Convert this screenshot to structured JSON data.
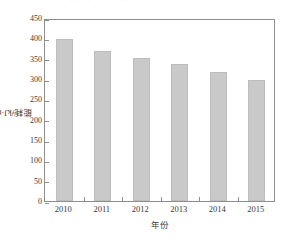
{
  "caption": {
    "text": "图 2  某企业吨产品能耗年际变化。"
  },
  "chart_data": {
    "type": "bar",
    "title": "",
    "categories": [
      "2010",
      "2011",
      "2012",
      "2013",
      "2014",
      "2015"
    ],
    "values": [
      398,
      368,
      352,
      338,
      318,
      297
    ],
    "series": [
      {
        "name": "能耗",
        "values": [
          398,
          368,
          352,
          338,
          318,
          297
        ]
      }
    ],
    "xlabel": "年份",
    "ylabel": "能耗/kJ·t",
    "ylabel_exponent": "-1",
    "ylim": [
      0,
      450
    ],
    "yticks": [
      0,
      50,
      100,
      150,
      200,
      250,
      300,
      350,
      400,
      450
    ],
    "ytick_labels": [
      "0",
      "50",
      "100",
      "150",
      "200",
      "250",
      "300",
      "350",
      "400",
      "450"
    ],
    "grid": false,
    "legend": "none",
    "bar_color": "#c9c9c9",
    "axis_color": "#8e8e8e",
    "text_color": "#3a3a3a"
  }
}
